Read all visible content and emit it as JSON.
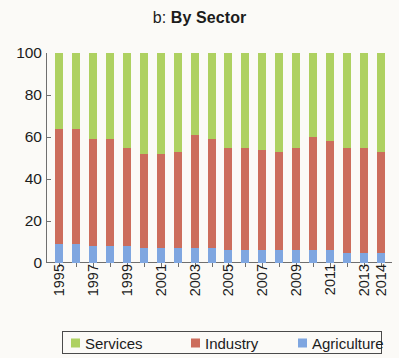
{
  "chart_data": {
    "type": "bar",
    "subtype": "stacked-100-percent",
    "title": "b: By Sector",
    "title_prefix": "b:",
    "title_main": "By Sector",
    "xlabel": "",
    "ylabel": "",
    "ylim": [
      0,
      100
    ],
    "yticks": [
      0,
      20,
      40,
      60,
      80,
      100
    ],
    "ytick_labels": [
      "0",
      "20",
      "40",
      "60",
      "80",
      "100"
    ],
    "grid": false,
    "legend_position": "bottom",
    "x": [
      1995,
      1996,
      1997,
      1998,
      1999,
      2000,
      2001,
      2002,
      2003,
      2004,
      2005,
      2006,
      2007,
      2008,
      2009,
      2010,
      2011,
      2012,
      2013,
      2014
    ],
    "categories": [
      "1995",
      "1996",
      "1997",
      "1998",
      "1999",
      "2000",
      "2001",
      "2002",
      "2003",
      "2004",
      "2005",
      "2006",
      "2007",
      "2008",
      "2009",
      "2010",
      "2011",
      "2012",
      "2013",
      "2014"
    ],
    "xtick_labels": [
      "1995",
      "1997",
      "1999",
      "2001",
      "2003",
      "2005",
      "2007",
      "2009",
      "2011",
      "2013",
      "2014"
    ],
    "xtick_positions": [
      1995,
      1997,
      1999,
      2001,
      2003,
      2005,
      2007,
      2009,
      2011,
      2013,
      2014
    ],
    "stack_order_bottom_to_top": [
      "Agriculture",
      "Industry",
      "Services"
    ],
    "series": [
      {
        "name": "Agriculture",
        "color": "#7fa6e0",
        "values": [
          9,
          9,
          8,
          8,
          8,
          7,
          7,
          7,
          7,
          7,
          6,
          6,
          6,
          6,
          6,
          6,
          6,
          5,
          5,
          5
        ]
      },
      {
        "name": "Industry",
        "color": "#cc6d5c",
        "values": [
          55,
          55,
          51,
          51,
          47,
          45,
          45,
          46,
          54,
          52,
          49,
          49,
          48,
          47,
          49,
          54,
          52,
          50,
          50,
          48
        ]
      },
      {
        "name": "Services",
        "color": "#aed161",
        "values": [
          36,
          36,
          41,
          41,
          45,
          48,
          48,
          47,
          39,
          41,
          45,
          45,
          46,
          47,
          45,
          40,
          42,
          45,
          45,
          47
        ]
      }
    ],
    "cumulative_tops": {
      "agriculture_top": [
        9,
        9,
        8,
        8,
        8,
        7,
        7,
        7,
        7,
        7,
        6,
        6,
        6,
        6,
        6,
        6,
        6,
        5,
        5,
        5
      ],
      "industry_top": [
        64,
        64,
        59,
        59,
        55,
        52,
        52,
        53,
        61,
        59,
        55,
        55,
        54,
        53,
        55,
        60,
        58,
        55,
        55,
        53
      ],
      "services_top": [
        100,
        100,
        100,
        100,
        100,
        100,
        100,
        100,
        100,
        100,
        100,
        100,
        100,
        100,
        100,
        100,
        100,
        100,
        100,
        100
      ]
    }
  },
  "legend": {
    "items": [
      {
        "label": "Services",
        "color": "#aed161"
      },
      {
        "label": "Industry",
        "color": "#cc6d5c"
      },
      {
        "label": "Agriculture",
        "color": "#7fa6e0"
      }
    ]
  },
  "colors": {
    "services": "#aed161",
    "industry": "#cc6d5c",
    "agriculture": "#7fa6e0",
    "axis": "#6f6f6f",
    "text": "#1c1c1c",
    "background": "#fbfaf7"
  }
}
